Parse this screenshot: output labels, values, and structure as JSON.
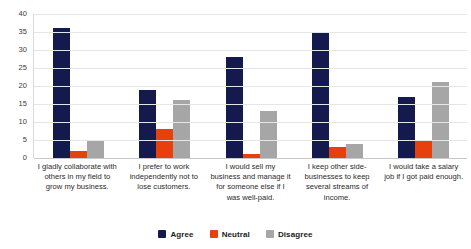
{
  "chart_data": {
    "type": "bar",
    "title": "",
    "xlabel": "",
    "ylabel": "",
    "ylim": [
      0,
      40
    ],
    "ytick_step": 5,
    "yticks": [
      "0",
      "5",
      "10",
      "15",
      "20",
      "25",
      "30",
      "35",
      "40"
    ],
    "grid": true,
    "legend_position": "bottom",
    "categories": [
      "I gladly collaborate with others in my field to grow my business.",
      "I prefer to work independently not to lose customers.",
      "I would sell my business and manage it for someone else if I was well-paid.",
      "I keep other side-businesses to keep several streams of income.",
      "I would take a salary job if I got paid enough."
    ],
    "series": [
      {
        "name": "Agree",
        "color": "#141a4e",
        "values": [
          36,
          19,
          28,
          35,
          17
        ]
      },
      {
        "name": "Neutral",
        "color": "#e8400c",
        "values": [
          2,
          8,
          1,
          3,
          5
        ]
      },
      {
        "name": "Disagree",
        "color": "#a6a6a6",
        "values": [
          5,
          16,
          13,
          4,
          21
        ]
      }
    ]
  },
  "colors": {
    "agree": "#141a4e",
    "neutral": "#e8400c",
    "disagree": "#a6a6a6",
    "gridline": "#e6e6e6",
    "background": "#ffffff",
    "text": "#262626"
  }
}
